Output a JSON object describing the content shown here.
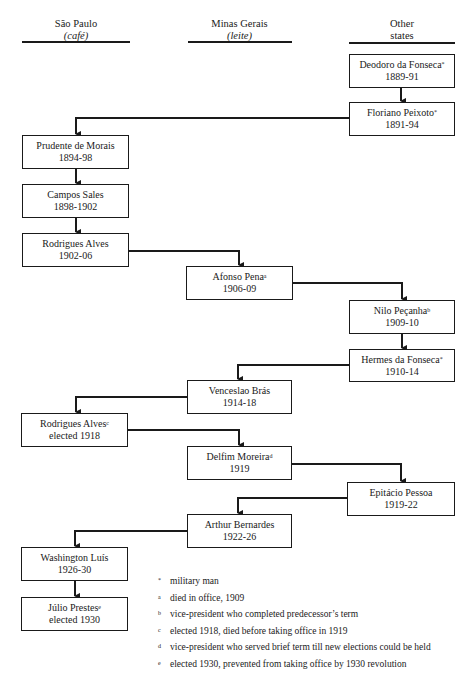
{
  "columns": [
    {
      "title": "São Paulo",
      "subtitle": "(café)"
    },
    {
      "title": "Minas Gerais",
      "subtitle": "(leite)"
    },
    {
      "title": "Other",
      "subtitle": "states"
    }
  ],
  "presidents": [
    {
      "name": "Deodoro da Fonseca",
      "mark": "*",
      "term": "1889-91",
      "column": "Other states"
    },
    {
      "name": "Floriano Peixoto",
      "mark": "*",
      "term": "1891-94",
      "column": "Other states"
    },
    {
      "name": "Prudente de Morais",
      "mark": "",
      "term": "1894-98",
      "column": "São Paulo"
    },
    {
      "name": "Campos Sales",
      "mark": "",
      "term": "1898-1902",
      "column": "São Paulo"
    },
    {
      "name": "Rodrigues Alves",
      "mark": "",
      "term": "1902-06",
      "column": "São Paulo"
    },
    {
      "name": "Afonso Pena",
      "mark": "a",
      "term": "1906-09",
      "column": "Minas Gerais"
    },
    {
      "name": "Nilo Peçanha",
      "mark": "b",
      "term": "1909-10",
      "column": "Other states"
    },
    {
      "name": "Hermes da Fonseca",
      "mark": "*",
      "term": "1910-14",
      "column": "Other states"
    },
    {
      "name": "Venceslao Brás",
      "mark": "",
      "term": "1914-18",
      "column": "Minas Gerais"
    },
    {
      "name": "Rodrigues Alves",
      "mark": "c",
      "term": "elected 1918",
      "column": "São Paulo"
    },
    {
      "name": "Delfim Moreira",
      "mark": "d",
      "term": "1919",
      "column": "Minas Gerais"
    },
    {
      "name": "Epitácio Pessoa",
      "mark": "",
      "term": "1919-22",
      "column": "Other states"
    },
    {
      "name": "Arthur Bernardes",
      "mark": "",
      "term": "1922-26",
      "column": "Minas Gerais"
    },
    {
      "name": "Washington Luís",
      "mark": "",
      "term": "1926-30",
      "column": "São Paulo"
    },
    {
      "name": "Júlio Prestes",
      "mark": "e",
      "term": "elected 1930",
      "column": "São Paulo"
    }
  ],
  "legend": [
    {
      "mark": "*",
      "text": "military man"
    },
    {
      "mark": "a",
      "text": "died in office, 1909"
    },
    {
      "mark": "b",
      "text": "vice-president who completed predecessor’s term"
    },
    {
      "mark": "c",
      "text": "elected 1918, died before taking office in 1919"
    },
    {
      "mark": "d",
      "text": "vice-president who served brief term till new elections could be held"
    },
    {
      "mark": "e",
      "text": "elected 1930, prevented from taking office by 1930 revolution"
    }
  ]
}
